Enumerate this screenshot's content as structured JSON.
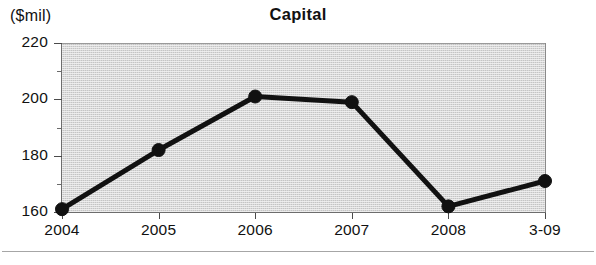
{
  "chart_data": {
    "type": "line",
    "title": "Capital",
    "unit_label": "($mil)",
    "xlabel": "",
    "ylabel": "",
    "categories": [
      "2004",
      "2005",
      "2006",
      "2007",
      "2008",
      "3-09"
    ],
    "values": [
      161,
      182,
      201,
      199,
      162,
      171
    ],
    "series": [
      {
        "name": "Capital",
        "values": [
          161,
          182,
          201,
          199,
          162,
          171
        ]
      }
    ],
    "ylim": [
      160,
      220
    ],
    "xlim": [
      0,
      5
    ],
    "y_major_ticks": [
      220,
      200,
      180,
      160
    ],
    "y_minor_ticks": [
      210,
      190,
      170
    ],
    "y_tick_labels": [
      "220",
      "200",
      "180",
      "160"
    ],
    "grid": false,
    "legend": null,
    "legend_position": "none",
    "marker": "circle",
    "line_color": "#111111",
    "marker_color": "#111111",
    "plot_background": "#dddddd",
    "annotations": []
  },
  "figure": {
    "title": "Capital",
    "unit_label": "($mil)"
  }
}
